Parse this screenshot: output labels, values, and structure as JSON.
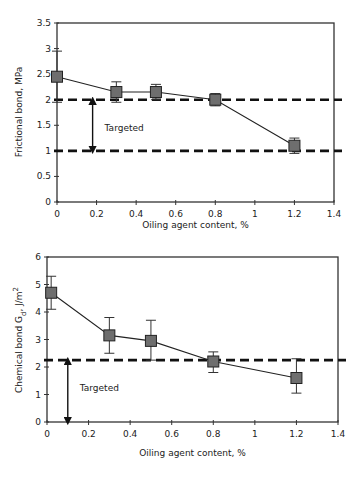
{
  "chart_data": [
    {
      "type": "line",
      "title": "",
      "xlabel": "Oiling agent content, %",
      "ylabel": "Frictional bond, MPa",
      "xlim": [
        0,
        1.4
      ],
      "ylim": [
        0,
        3.5
      ],
      "xticks": [
        "0",
        "0.2",
        "0.4",
        "0.6",
        "0.8",
        "1",
        "1.2",
        "1.4"
      ],
      "yticks": [
        "0",
        "0.5",
        "1",
        "1.5",
        "2",
        "2.5",
        "3",
        "3.5"
      ],
      "grid": false,
      "legend": null,
      "series": [
        {
          "name": "Frictional bond",
          "marker": "square",
          "x": [
            0.0,
            0.3,
            0.5,
            0.8,
            1.2
          ],
          "y": [
            2.45,
            2.15,
            2.15,
            2.0,
            1.1
          ],
          "error_high": [
            2.95,
            2.35,
            2.3,
            2.12,
            1.25
          ],
          "error_low": [
            1.95,
            1.95,
            2.0,
            1.88,
            0.95
          ]
        }
      ],
      "reference_lines": [
        {
          "y": 2.0,
          "style": "dashed"
        },
        {
          "y": 1.0,
          "style": "dashed"
        }
      ],
      "annotations": [
        {
          "text": "Targeted",
          "arrow": "double",
          "x": 0.18,
          "y_from": 1.0,
          "y_to": 2.0
        }
      ]
    },
    {
      "type": "line",
      "title": "",
      "xlabel": "Oiling agent content, %",
      "ylabel": "Chemical bond Gd, J/m2",
      "ylabel_parts": {
        "main": "Chemical bond G",
        "sub": "d",
        "unit": ", J/m",
        "sup": "2"
      },
      "xlim": [
        0,
        1.4
      ],
      "ylim": [
        0,
        6
      ],
      "xticks": [
        "0",
        "0.2",
        "0.4",
        "0.6",
        "0.8",
        "1",
        "1.2",
        "1.4"
      ],
      "yticks": [
        "0",
        "1",
        "2",
        "3",
        "4",
        "5",
        "6"
      ],
      "grid": false,
      "legend": null,
      "series": [
        {
          "name": "Chemical bond",
          "marker": "square",
          "x": [
            0.02,
            0.3,
            0.5,
            0.8,
            1.2
          ],
          "y": [
            4.7,
            3.15,
            2.95,
            2.2,
            1.6
          ],
          "error_high": [
            5.3,
            3.8,
            3.7,
            2.55,
            2.3
          ],
          "error_low": [
            4.1,
            2.5,
            2.25,
            1.8,
            1.05
          ]
        }
      ],
      "reference_lines": [
        {
          "y": 2.25,
          "style": "dashed"
        }
      ],
      "annotations": [
        {
          "text": "Targeted",
          "arrow": "double",
          "x": 0.1,
          "y_from": 0,
          "y_to": 2.25
        }
      ]
    }
  ]
}
